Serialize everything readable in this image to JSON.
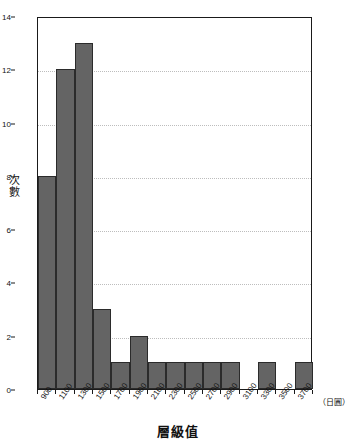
{
  "chart_data": {
    "type": "bar",
    "title": "",
    "xlabel": "層級值",
    "ylabel": "次數",
    "x_unit": "（日圓）",
    "categories": [
      "900",
      "1100",
      "1300",
      "1500",
      "1700",
      "1900",
      "2100",
      "2300",
      "2500",
      "2700",
      "2900",
      "3100",
      "3300",
      "3500",
      "3700"
    ],
    "values": [
      8,
      12,
      13,
      3,
      1,
      2,
      1,
      1,
      1,
      1,
      1,
      0,
      1,
      0,
      1
    ],
    "ylim": [
      0,
      14
    ],
    "ytick_labels": [
      "0",
      "2",
      "4",
      "6",
      "8",
      "10",
      "12",
      "14"
    ],
    "ytick_values": [
      0,
      2,
      4,
      6,
      8,
      10,
      12,
      14
    ],
    "grid": true,
    "legend": "none",
    "bar_color": "#646464",
    "bar_border_color": "#2b2b2b",
    "axis_color": "#1a1a1a",
    "grid_color": "#bdbdbd"
  }
}
